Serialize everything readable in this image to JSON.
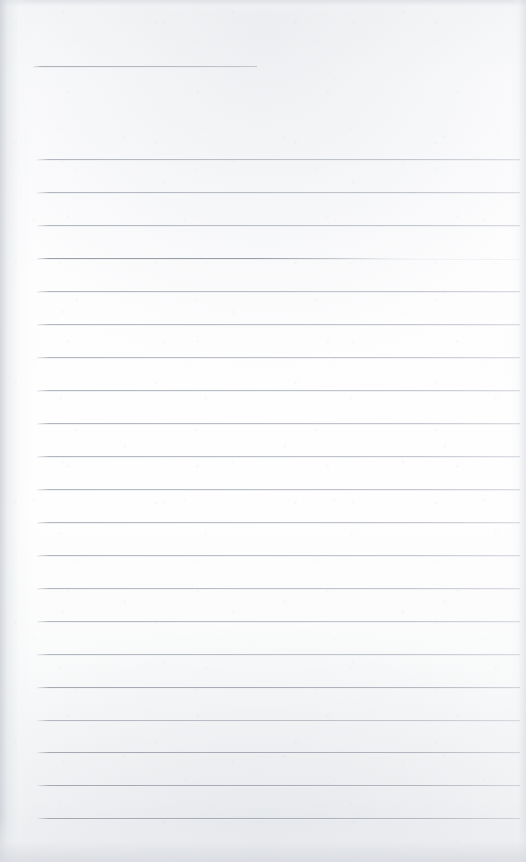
{
  "document": {
    "kind": "scanned-blank-ruled-page",
    "page_width": 526,
    "page_height": 862,
    "background_color": "#fcfcfd",
    "rule_color": "#b0b4bb",
    "title_text": "",
    "body_text": "",
    "visible_text": []
  },
  "header_rule": {
    "label": "",
    "x": 33,
    "y": 66,
    "width": 224,
    "thickness": 1
  },
  "body_rules": {
    "start_x": 37,
    "end_x": 520,
    "first_y": 159,
    "spacing": 33,
    "count": 21,
    "lines": [
      {
        "index": 1,
        "y": 159,
        "weight": "normal",
        "text": ""
      },
      {
        "index": 2,
        "y": 192,
        "weight": "normal",
        "text": ""
      },
      {
        "index": 3,
        "y": 225,
        "weight": "normal",
        "text": ""
      },
      {
        "index": 4,
        "y": 258,
        "weight": "fading",
        "text": ""
      },
      {
        "index": 5,
        "y": 291,
        "weight": "normal",
        "text": ""
      },
      {
        "index": 6,
        "y": 324,
        "weight": "normal",
        "text": ""
      },
      {
        "index": 7,
        "y": 357,
        "weight": "normal",
        "text": ""
      },
      {
        "index": 8,
        "y": 390,
        "weight": "normal",
        "text": ""
      },
      {
        "index": 9,
        "y": 423,
        "weight": "normal",
        "text": ""
      },
      {
        "index": 10,
        "y": 456,
        "weight": "normal",
        "text": ""
      },
      {
        "index": 11,
        "y": 489,
        "weight": "normal",
        "text": ""
      },
      {
        "index": 12,
        "y": 522,
        "weight": "normal",
        "text": ""
      },
      {
        "index": 13,
        "y": 555,
        "weight": "normal",
        "text": ""
      },
      {
        "index": 14,
        "y": 588,
        "weight": "normal",
        "text": ""
      },
      {
        "index": 15,
        "y": 621,
        "weight": "normal",
        "text": ""
      },
      {
        "index": 16,
        "y": 654,
        "weight": "normal",
        "text": ""
      },
      {
        "index": 17,
        "y": 687,
        "weight": "heavy",
        "text": ""
      },
      {
        "index": 18,
        "y": 720,
        "weight": "normal",
        "text": ""
      },
      {
        "index": 19,
        "y": 752,
        "weight": "heavy",
        "text": ""
      },
      {
        "index": 20,
        "y": 785,
        "weight": "heavy",
        "text": ""
      },
      {
        "index": 21,
        "y": 818,
        "weight": "heavy",
        "text": ""
      }
    ]
  }
}
